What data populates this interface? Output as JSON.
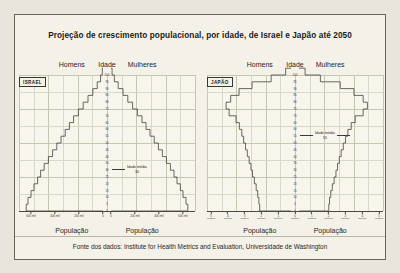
{
  "figure": {
    "title": "Projeção de crescimento populacional, por idade, de Israel e Japão até 2050",
    "source": "Fonte dos dados: Institute for Health Metrics and Evaluation, Universidade de Washington",
    "background": "#f4f2e8",
    "line_color": "#3c3a33",
    "grid_color": "#d6d8c8"
  },
  "panels": [
    {
      "badge": "ISRAEL",
      "men_label": "Homens",
      "age_label": "Idade",
      "women_label": "Mulheres",
      "population_label_left": "População",
      "population_label_right": "População",
      "median_label": "Idade média",
      "median_value": "30",
      "x_ticks": [
        "600 mil",
        "400 mil",
        "200 mil",
        "0",
        "0",
        "200 mil",
        "400 mil",
        "600 mil"
      ]
    },
    {
      "badge": "JAPÃO",
      "men_label": "Homens",
      "age_label": "Idade",
      "women_label": "Mulheres",
      "population_label_left": "População",
      "population_label_right": "População",
      "median_label": "Idade média",
      "median_value": "55",
      "x_ticks": [
        "5",
        "4",
        "3",
        "2",
        "1",
        "0",
        "1",
        "2",
        "3",
        "4",
        "5"
      ],
      "x_unit": "milhões"
    }
  ],
  "chart_data": {
    "type": "bar",
    "title": "Projeção de crescimento populacional, por idade, de Israel e Japão até 2050",
    "subtitle": "",
    "orientation": "population-pyramid",
    "ylabel": "Idade",
    "xlabel": "População",
    "grid": true,
    "legend": [
      "Homens",
      "Mulheres"
    ],
    "age_ticks": [
      0,
      5,
      10,
      15,
      20,
      25,
      30,
      35,
      40,
      45,
      50,
      55,
      60,
      65,
      70,
      75,
      80,
      85,
      90,
      95,
      100
    ],
    "charts": [
      {
        "name": "ISRAEL",
        "unit": "mil",
        "xlim": [
          0,
          700
        ],
        "x_ticks": [
          600,
          400,
          200,
          0
        ],
        "median_age": 30,
        "age_bands": [
          0,
          5,
          10,
          15,
          20,
          25,
          30,
          35,
          40,
          45,
          50,
          55,
          60,
          65,
          70,
          75,
          80,
          85,
          90,
          95,
          100
        ],
        "men": [
          640,
          625,
          600,
          575,
          545,
          520,
          490,
          455,
          420,
          385,
          350,
          315,
          280,
          245,
          205,
          165,
          125,
          85,
          48,
          20,
          6
        ],
        "women": [
          640,
          625,
          600,
          578,
          550,
          525,
          495,
          462,
          428,
          395,
          360,
          325,
          292,
          258,
          220,
          180,
          140,
          100,
          60,
          28,
          9
        ]
      },
      {
        "name": "JAPÃO",
        "unit": "milhões",
        "xlim": [
          0,
          5.5
        ],
        "x_ticks": [
          5,
          4,
          3,
          2,
          1,
          0
        ],
        "median_age": 55,
        "age_bands": [
          0,
          5,
          10,
          15,
          20,
          25,
          30,
          35,
          40,
          45,
          50,
          55,
          60,
          65,
          70,
          75,
          80,
          85,
          90,
          95,
          100
        ],
        "men": [
          2.05,
          2.1,
          2.18,
          2.28,
          2.4,
          2.52,
          2.62,
          2.74,
          2.86,
          2.98,
          3.1,
          3.22,
          3.38,
          3.6,
          4.05,
          4.25,
          3.95,
          3.4,
          2.55,
          1.3,
          0.35
        ],
        "women": [
          1.95,
          2.0,
          2.08,
          2.18,
          2.3,
          2.42,
          2.52,
          2.64,
          2.76,
          2.9,
          3.05,
          3.2,
          3.42,
          3.68,
          4.2,
          4.48,
          4.2,
          3.6,
          2.7,
          1.4,
          0.4
        ]
      }
    ]
  }
}
